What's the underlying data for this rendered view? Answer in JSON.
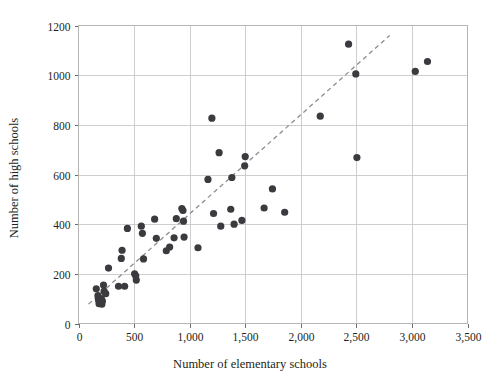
{
  "chart_data": {
    "type": "scatter",
    "title": "",
    "xlabel": "Number of elementary schools",
    "ylabel": "Number of high schools",
    "xlim": [
      0,
      3500
    ],
    "ylim": [
      0,
      1200
    ],
    "xticks": [
      0,
      500,
      1000,
      1500,
      2000,
      2500,
      3000,
      3500
    ],
    "xtick_labels": [
      "0",
      "500",
      "1,000",
      "1,500",
      "2,000",
      "2,500",
      "3,000",
      "3,500"
    ],
    "yticks": [
      0,
      200,
      400,
      600,
      800,
      1000,
      1200
    ],
    "ytick_labels": [
      "0",
      "200",
      "400",
      "600",
      "800",
      "1000",
      "1200"
    ],
    "grid": true,
    "legend": "none",
    "marker_color": "#3b3b3f",
    "trendline": {
      "style": "dashed",
      "color": "#8d8d8d",
      "x_start": 90,
      "y_start": 78,
      "x_end": 2800,
      "y_end": 1160
    },
    "points": [
      {
        "x": 160,
        "y": 140
      },
      {
        "x": 175,
        "y": 112
      },
      {
        "x": 180,
        "y": 95
      },
      {
        "x": 185,
        "y": 80
      },
      {
        "x": 195,
        "y": 85
      },
      {
        "x": 205,
        "y": 100
      },
      {
        "x": 210,
        "y": 78
      },
      {
        "x": 215,
        "y": 90
      },
      {
        "x": 225,
        "y": 155
      },
      {
        "x": 230,
        "y": 130
      },
      {
        "x": 245,
        "y": 120
      },
      {
        "x": 270,
        "y": 223
      },
      {
        "x": 360,
        "y": 150
      },
      {
        "x": 385,
        "y": 262
      },
      {
        "x": 392,
        "y": 295
      },
      {
        "x": 415,
        "y": 150
      },
      {
        "x": 440,
        "y": 383
      },
      {
        "x": 505,
        "y": 200
      },
      {
        "x": 515,
        "y": 192
      },
      {
        "x": 520,
        "y": 175
      },
      {
        "x": 565,
        "y": 392
      },
      {
        "x": 575,
        "y": 363
      },
      {
        "x": 585,
        "y": 260
      },
      {
        "x": 685,
        "y": 420
      },
      {
        "x": 700,
        "y": 343
      },
      {
        "x": 790,
        "y": 293
      },
      {
        "x": 820,
        "y": 308
      },
      {
        "x": 860,
        "y": 345
      },
      {
        "x": 880,
        "y": 422
      },
      {
        "x": 930,
        "y": 463
      },
      {
        "x": 940,
        "y": 455
      },
      {
        "x": 945,
        "y": 412
      },
      {
        "x": 950,
        "y": 348
      },
      {
        "x": 1075,
        "y": 305
      },
      {
        "x": 1165,
        "y": 580
      },
      {
        "x": 1200,
        "y": 827
      },
      {
        "x": 1215,
        "y": 443
      },
      {
        "x": 1265,
        "y": 688
      },
      {
        "x": 1280,
        "y": 392
      },
      {
        "x": 1370,
        "y": 460
      },
      {
        "x": 1380,
        "y": 588
      },
      {
        "x": 1400,
        "y": 400
      },
      {
        "x": 1470,
        "y": 415
      },
      {
        "x": 1495,
        "y": 635
      },
      {
        "x": 1500,
        "y": 672
      },
      {
        "x": 1670,
        "y": 465
      },
      {
        "x": 1745,
        "y": 542
      },
      {
        "x": 1855,
        "y": 448
      },
      {
        "x": 2175,
        "y": 835
      },
      {
        "x": 2430,
        "y": 1125
      },
      {
        "x": 2495,
        "y": 1005
      },
      {
        "x": 2505,
        "y": 668
      },
      {
        "x": 3030,
        "y": 1015
      },
      {
        "x": 3140,
        "y": 1055
      }
    ]
  },
  "axes": {
    "x_label": "Number of elementary schools",
    "y_label": "Number of high schools"
  }
}
